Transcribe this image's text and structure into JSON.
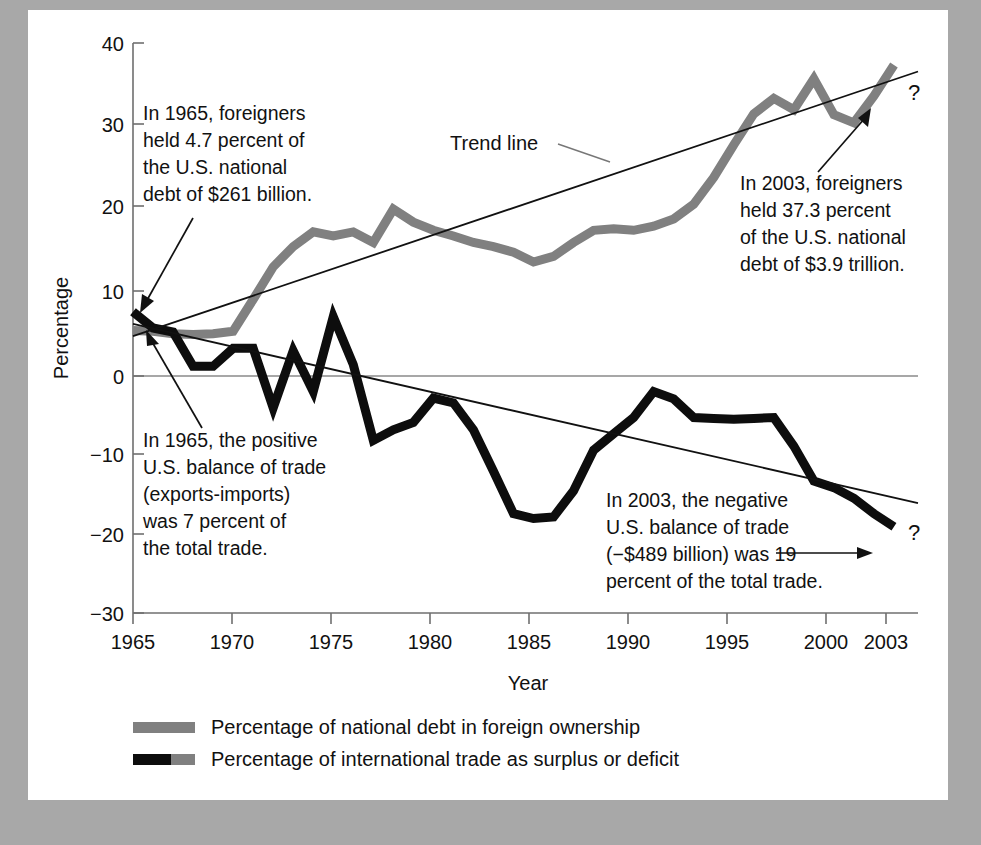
{
  "chart_data": {
    "type": "line",
    "title": "",
    "xlabel": "Year",
    "ylabel": "Percentage",
    "xlim": [
      1965,
      2004.2
    ],
    "ylim": [
      -30,
      40
    ],
    "xticks": [
      1965,
      1970,
      1975,
      1980,
      1985,
      1990,
      1995,
      2000,
      2003
    ],
    "xtick_labels": [
      "1965",
      "1970",
      "1975",
      "1980",
      "1985",
      "1990",
      "1995",
      "2000",
      "2003"
    ],
    "yticks": [
      -30,
      -20,
      -10,
      0,
      10,
      20,
      30,
      40
    ],
    "ytick_labels": [
      "−30",
      "−20",
      "−10",
      "0",
      "10",
      "20",
      "30",
      "40"
    ],
    "grid": false,
    "zero_line": true,
    "legend_position": "below-axes",
    "series": [
      {
        "name": "Percentage of national debt in foreign ownership",
        "color": "#808080",
        "linewidth": 9,
        "x": [
          1965,
          1966,
          1967,
          1968,
          1969,
          1970,
          1971,
          1972,
          1973,
          1974,
          1975,
          1976,
          1977,
          1978,
          1979,
          1980,
          1981,
          1982,
          1983,
          1984,
          1985,
          1986,
          1987,
          1988,
          1989,
          1990,
          1991,
          1992,
          1993,
          1994,
          1995,
          1996,
          1997,
          1998,
          1999,
          2000,
          2001,
          2002,
          2003
        ],
        "y": [
          4.7,
          4.6,
          4.3,
          4.2,
          4.3,
          4.6,
          8.5,
          12.5,
          15.0,
          16.8,
          16.3,
          16.8,
          15.5,
          19.6,
          18.0,
          17.0,
          16.3,
          15.5,
          15.0,
          14.3,
          13.1,
          13.8,
          15.5,
          17.0,
          17.2,
          17.0,
          17.5,
          18.4,
          20.2,
          23.5,
          27.5,
          31.3,
          33.2,
          31.8,
          35.6,
          31.2,
          30.2,
          33.5,
          37.3
        ]
      },
      {
        "name": "Percentage of international trade as surplus or deficit",
        "color": "#0d0d0d",
        "linewidth": 9,
        "x": [
          1965,
          1966,
          1967,
          1968,
          1969,
          1970,
          1971,
          1972,
          1973,
          1974,
          1975,
          1976,
          1977,
          1978,
          1979,
          1980,
          1981,
          1982,
          1983,
          1984,
          1985,
          1986,
          1987,
          1988,
          1989,
          1990,
          1991,
          1992,
          1993,
          1994,
          1995,
          1996,
          1997,
          1998,
          1999,
          2000,
          2001,
          2002,
          2003
        ],
        "y": [
          7.0,
          5.0,
          4.5,
          0.3,
          0.3,
          2.5,
          2.5,
          -4.8,
          2.2,
          -2.8,
          6.4,
          0.5,
          -8.8,
          -7.5,
          -6.6,
          -3.6,
          -4.2,
          -7.5,
          -12.6,
          -17.8,
          -18.4,
          -18.2,
          -15.0,
          -10.0,
          -8.0,
          -6.0,
          -2.8,
          -3.7,
          -6.0,
          -6.1,
          -6.2,
          -6.1,
          -6.0,
          -9.5,
          -13.8,
          -14.6,
          -15.9,
          -17.8,
          -19.4
        ]
      }
    ],
    "trend_lines": [
      {
        "name": "debt-trend",
        "label": "Trend line",
        "x": [
          1965,
          2004.2
        ],
        "y": [
          4.0,
          36.5
        ],
        "color": "#111111"
      },
      {
        "name": "trade-trend",
        "label": "",
        "x": [
          1965,
          2004.2
        ],
        "y": [
          5.5,
          -16.5
        ],
        "color": "#111111"
      }
    ],
    "annotations": [
      {
        "name": "debt-1965-annotation",
        "lines": [
          "In 1965, foreigners",
          "held 4.7 percent of",
          "the U.S. national",
          "debt of $261 billion."
        ]
      },
      {
        "name": "debt-2003-annotation",
        "lines": [
          "In 2003, foreigners",
          "held 37.3 percent",
          "of the U.S. national",
          "debt of $3.9 trillion."
        ]
      },
      {
        "name": "trade-1965-annotation",
        "lines": [
          "In 1965, the positive",
          "U.S. balance of trade",
          "(exports-imports)",
          "was 7 percent of",
          "the total trade."
        ]
      },
      {
        "name": "trade-2003-annotation",
        "lines": [
          "In 2003, the negative",
          "U.S. balance of trade",
          "(−$489 billion) was 19",
          "percent of the total trade."
        ]
      }
    ],
    "future_markers": [
      {
        "name": "debt-future-question",
        "text": "?"
      },
      {
        "name": "trade-future-question",
        "text": "?"
      }
    ],
    "trend_label": "Trend line"
  },
  "legend": {
    "items": [
      {
        "label": "Percentage of national debt in foreign ownership",
        "color": "#808080"
      },
      {
        "label": "Percentage of international trade as surplus or deficit",
        "color": "#0d0d0d"
      }
    ]
  },
  "colors": {
    "page_background": "#a8a8a8",
    "card_background": "#ffffff",
    "debt_series": "#808080",
    "trade_series": "#0d0d0d",
    "axis": "#555555",
    "text": "#111111"
  }
}
